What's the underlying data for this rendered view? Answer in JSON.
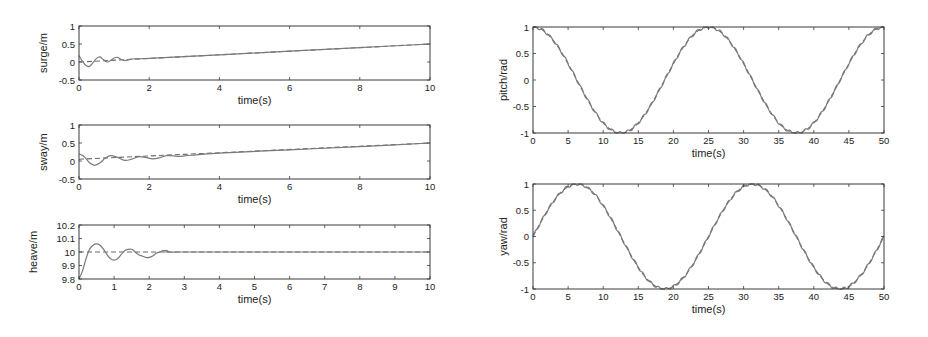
{
  "figure": {
    "background": "#ffffff",
    "line_color": "#7a7a7a",
    "ref_color": "#6a6a6a"
  },
  "chart_data": [
    {
      "id": "surge",
      "type": "line",
      "title": "",
      "xlabel": "time(s)",
      "ylabel": "surge/m",
      "xlim": [
        0,
        10
      ],
      "ylim": [
        -0.5,
        1
      ],
      "xticks": [
        0,
        2,
        4,
        6,
        8,
        10
      ],
      "yticks": [
        -0.5,
        0,
        0.5,
        1
      ],
      "ytick_labels": [
        "-0.5",
        "0",
        "0.5",
        "1"
      ],
      "grid": false,
      "box": {
        "x": 79,
        "y": 26,
        "w": 351,
        "h": 54
      },
      "series": [
        {
          "name": "reference",
          "style": "dashed",
          "x": [
            0,
            10
          ],
          "y": [
            0,
            0.5
          ]
        },
        {
          "name": "actual",
          "style": "solid",
          "x": [
            0,
            0.1,
            0.2,
            0.3,
            0.4,
            0.5,
            0.6,
            0.7,
            0.8,
            0.9,
            1.0,
            1.1,
            1.2,
            1.3,
            1.4,
            1.5,
            1.6,
            2,
            4,
            6,
            8,
            10
          ],
          "y": [
            0.18,
            0.02,
            -0.1,
            -0.12,
            -0.02,
            0.1,
            0.14,
            0.06,
            0.0,
            0.04,
            0.11,
            0.13,
            0.07,
            0.04,
            0.06,
            0.08,
            0.09,
            0.1,
            0.2,
            0.3,
            0.4,
            0.5
          ]
        }
      ]
    },
    {
      "id": "sway",
      "type": "line",
      "title": "",
      "xlabel": "time(s)",
      "ylabel": "sway/m",
      "xlim": [
        0,
        10
      ],
      "ylim": [
        -0.5,
        1
      ],
      "xticks": [
        0,
        2,
        4,
        6,
        8,
        10
      ],
      "yticks": [
        -0.5,
        0,
        0.5,
        1
      ],
      "ytick_labels": [
        "-0.5",
        "0",
        "0.5",
        "1"
      ],
      "grid": false,
      "box": {
        "x": 79,
        "y": 125,
        "w": 351,
        "h": 54
      },
      "series": [
        {
          "name": "reference",
          "style": "dashed",
          "x": [
            0,
            10
          ],
          "y": [
            0.05,
            0.5
          ]
        },
        {
          "name": "actual",
          "style": "solid",
          "x": [
            0,
            0.15,
            0.3,
            0.45,
            0.6,
            0.75,
            0.9,
            1.1,
            1.3,
            1.5,
            1.7,
            1.9,
            2.1,
            2.3,
            2.5,
            2.7,
            2.9,
            3.2,
            4,
            6,
            8,
            10
          ],
          "y": [
            0.2,
            0.12,
            -0.05,
            -0.12,
            -0.05,
            0.08,
            0.15,
            0.1,
            0.02,
            0.05,
            0.12,
            0.1,
            0.06,
            0.09,
            0.15,
            0.14,
            0.13,
            0.16,
            0.22,
            0.31,
            0.4,
            0.5
          ]
        }
      ]
    },
    {
      "id": "heave",
      "type": "line",
      "title": "",
      "xlabel": "time(s)",
      "ylabel": "heave/m",
      "xlim": [
        0,
        10
      ],
      "ylim": [
        9.8,
        10.2
      ],
      "xticks": [
        0,
        1,
        2,
        3,
        4,
        5,
        6,
        7,
        8,
        9,
        10
      ],
      "yticks": [
        9.8,
        9.9,
        10,
        10.1,
        10.2
      ],
      "ytick_labels": [
        "9.8",
        "9.9",
        "10",
        "10.1",
        "10.2"
      ],
      "grid": false,
      "box": {
        "x": 79,
        "y": 225,
        "w": 351,
        "h": 54
      },
      "series": [
        {
          "name": "reference",
          "style": "dashed",
          "x": [
            0,
            10
          ],
          "y": [
            10,
            10
          ]
        },
        {
          "name": "actual",
          "style": "solid",
          "x": [
            0,
            0.1,
            0.2,
            0.3,
            0.4,
            0.5,
            0.6,
            0.7,
            0.8,
            0.9,
            1.0,
            1.1,
            1.2,
            1.3,
            1.4,
            1.5,
            1.6,
            1.7,
            1.8,
            1.9,
            2.0,
            2.1,
            2.2,
            2.3,
            2.4,
            2.5,
            2.6,
            2.8,
            3,
            10
          ],
          "y": [
            9.8,
            9.86,
            9.95,
            10.02,
            10.05,
            10.06,
            10.05,
            10.02,
            9.98,
            9.95,
            9.94,
            9.95,
            9.98,
            10.01,
            10.02,
            10.02,
            10.0,
            9.98,
            9.97,
            9.96,
            9.96,
            9.97,
            9.99,
            10.0,
            10.01,
            10.01,
            10.0,
            10.0,
            10.0,
            10.0
          ]
        }
      ]
    },
    {
      "id": "pitch",
      "type": "line",
      "title": "",
      "xlabel": "time(s)",
      "ylabel": "pitch/rad",
      "xlim": [
        0,
        50
      ],
      "ylim": [
        -1,
        1
      ],
      "xticks": [
        0,
        5,
        10,
        15,
        20,
        25,
        30,
        35,
        40,
        45,
        50
      ],
      "yticks": [
        -1,
        -0.5,
        0,
        0.5,
        1
      ],
      "ytick_labels": [
        "-1",
        "-0.5",
        "0",
        "0.5",
        "1"
      ],
      "grid": false,
      "box": {
        "x": 533,
        "y": 27,
        "w": 351,
        "h": 106
      },
      "series": [
        {
          "name": "reference",
          "style": "dashed",
          "function": "cos",
          "period": 25,
          "amplitude": 1,
          "x_range": [
            0,
            50
          ]
        },
        {
          "name": "actual",
          "style": "solid",
          "function": "cos",
          "period": 25,
          "amplitude": 1,
          "ripple": 0.025,
          "x_range": [
            0,
            50
          ]
        }
      ]
    },
    {
      "id": "yaw",
      "type": "line",
      "title": "",
      "xlabel": "time(s)",
      "ylabel": "yaw/rad",
      "xlim": [
        0,
        50
      ],
      "ylim": [
        -1,
        1
      ],
      "xticks": [
        0,
        5,
        10,
        15,
        20,
        25,
        30,
        35,
        40,
        45,
        50
      ],
      "yticks": [
        -1,
        -0.5,
        0,
        0.5,
        1
      ],
      "ytick_labels": [
        "-1",
        "-0.5",
        "0",
        "0.5",
        "1"
      ],
      "grid": false,
      "box": {
        "x": 533,
        "y": 184,
        "w": 351,
        "h": 105
      },
      "series": [
        {
          "name": "reference",
          "style": "dashed",
          "function": "sin",
          "period": 25,
          "amplitude": 1,
          "x_range": [
            0,
            50
          ]
        },
        {
          "name": "actual",
          "style": "solid",
          "function": "sin",
          "period": 25,
          "amplitude": 1,
          "ripple": 0.025,
          "x_range": [
            0,
            50
          ]
        }
      ]
    }
  ]
}
